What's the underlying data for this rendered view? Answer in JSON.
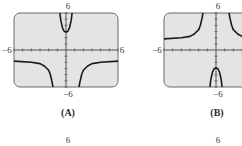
{
  "chart_data": [
    {
      "type": "line",
      "panel": "A",
      "caption": "(A)",
      "title": "",
      "xlabel": "",
      "ylabel": "",
      "xlim": [
        -6,
        6
      ],
      "ylim": [
        -6,
        6
      ],
      "tick_labels": {
        "x_min": "−6",
        "x_max": "6",
        "y_min": "−6",
        "y_max": "6"
      },
      "grid": false,
      "series": [
        {
          "name": "left-branch",
          "x": [
            -6,
            -4,
            -3,
            -2.5,
            -2,
            -1.8,
            -1.6,
            -1.5
          ],
          "y": [
            -1.8,
            -2.0,
            -2.2,
            -2.6,
            -3.3,
            -4.0,
            -5.2,
            -6
          ]
        },
        {
          "name": "center-branch",
          "x": [
            -0.7,
            -0.6,
            -0.4,
            -0.2,
            0,
            0.2,
            0.4,
            0.6,
            0.7
          ],
          "y": [
            6,
            4.8,
            3.6,
            3.0,
            2.9,
            3.0,
            3.6,
            4.8,
            6
          ]
        },
        {
          "name": "right-branch",
          "x": [
            1.5,
            1.6,
            1.8,
            2,
            2.5,
            3,
            4,
            6
          ],
          "y": [
            -6,
            -5.2,
            -4.0,
            -3.3,
            -2.6,
            -2.2,
            -2.0,
            -1.8
          ]
        }
      ]
    },
    {
      "type": "line",
      "panel": "B",
      "caption": "(B)",
      "title": "",
      "xlabel": "",
      "ylabel": "",
      "xlim": [
        -6,
        6
      ],
      "ylim": [
        -6,
        6
      ],
      "tick_labels": {
        "x_min": "−6",
        "x_max": "6",
        "y_min": "−6",
        "y_max": "6"
      },
      "grid": false,
      "series": [
        {
          "name": "left-branch",
          "x": [
            -6,
            -4,
            -3,
            -2.5,
            -2,
            -1.8,
            -1.6,
            -1.5
          ],
          "y": [
            1.8,
            2.0,
            2.2,
            2.6,
            3.3,
            4.0,
            5.2,
            6
          ]
        },
        {
          "name": "center-branch",
          "x": [
            -0.7,
            -0.6,
            -0.4,
            -0.2,
            0,
            0.2,
            0.4,
            0.6,
            0.7
          ],
          "y": [
            -6,
            -4.8,
            -3.6,
            -3.0,
            -2.9,
            -3.0,
            -3.6,
            -4.8,
            -6
          ]
        },
        {
          "name": "right-branch",
          "x": [
            1.5,
            1.6,
            1.8,
            2,
            2.5,
            3,
            4,
            6
          ],
          "y": [
            6,
            5.2,
            4.0,
            3.3,
            2.6,
            2.2,
            2.0,
            1.8
          ]
        }
      ]
    }
  ],
  "next_row": {
    "label_a": "6",
    "label_b": "6"
  }
}
